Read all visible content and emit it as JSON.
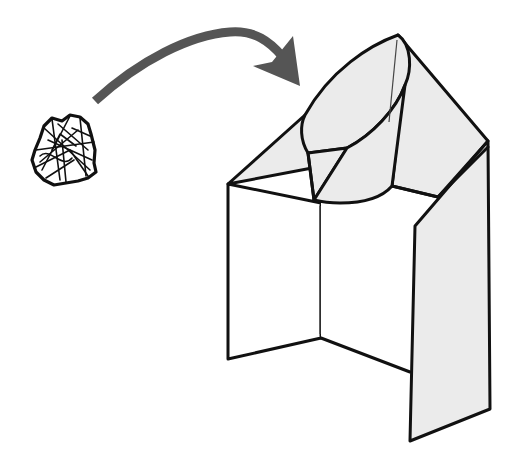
{
  "diagram": {
    "type": "origami-step-illustration",
    "description": "Crumpled paper ball with curved arrow pointing to a folded paper box/hood shape",
    "colors": {
      "background": "#ffffff",
      "outline": "#111111",
      "paper_fill": "#ebebeb",
      "arrow": "#555555",
      "crease": "#444444"
    },
    "elements": [
      {
        "name": "crumpled-paper-ball",
        "label": "crumpled paper"
      },
      {
        "name": "curved-arrow",
        "label": "move into"
      },
      {
        "name": "folded-paper-structure",
        "label": "folded paper hood"
      }
    ]
  }
}
